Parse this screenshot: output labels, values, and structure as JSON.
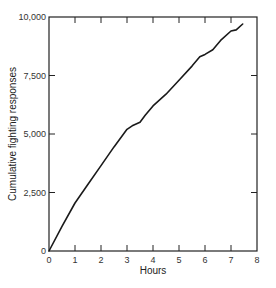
{
  "chart_data": {
    "type": "line",
    "title": "",
    "xlabel": "Hours",
    "ylabel": "Cumulative fighting responses",
    "xlim": [
      0,
      8
    ],
    "ylim": [
      0,
      10000
    ],
    "x_ticks": [
      0,
      1,
      2,
      3,
      4,
      5,
      6,
      7,
      8
    ],
    "x_tick_labels": [
      "0",
      "1",
      "2",
      "3",
      "4",
      "5",
      "6",
      "7",
      "8"
    ],
    "y_ticks": [
      0,
      2500,
      5000,
      7500,
      10000
    ],
    "y_tick_labels": [
      "0",
      "2,500",
      "5,000",
      "7,500",
      "10,000"
    ],
    "grid": false,
    "legend": null,
    "series": [
      {
        "name": "Cumulative fighting responses",
        "x": [
          0,
          0.5,
          1.0,
          1.5,
          2.0,
          2.5,
          3.0,
          3.2,
          3.5,
          3.7,
          4.0,
          4.5,
          5.0,
          5.5,
          5.8,
          6.0,
          6.3,
          6.6,
          7.0,
          7.2,
          7.45
        ],
        "values": [
          0,
          1050,
          2050,
          2850,
          3650,
          4450,
          5200,
          5350,
          5500,
          5800,
          6200,
          6700,
          7300,
          7900,
          8300,
          8400,
          8600,
          9000,
          9400,
          9450,
          9700
        ]
      }
    ]
  },
  "axes": {
    "xlabel": "Hours",
    "ylabel": "Cumulative fighting responses",
    "x_tick_labels": [
      "0",
      "1",
      "2",
      "3",
      "4",
      "5",
      "6",
      "7",
      "8"
    ],
    "y_tick_labels": [
      "0",
      "2,500",
      "5,000",
      "7,500",
      "10,000"
    ]
  },
  "colors": {
    "line": "#1a1a1a",
    "axis": "#222222",
    "background": "#ffffff"
  }
}
